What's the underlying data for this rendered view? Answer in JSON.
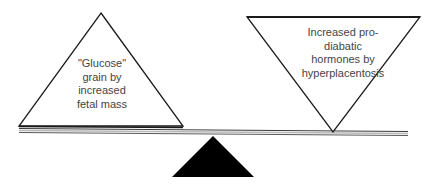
{
  "diagram": {
    "type": "balance-scale",
    "left_weight": {
      "shape": "triangle-up",
      "label": "\"Glucose\"\ngrain by\nincreased\nfetal mass"
    },
    "right_weight": {
      "shape": "triangle-down",
      "label": "Increased pro-\ndiabatic\nhormones by\nhyperplacentosis"
    },
    "beam": {
      "shape": "double-line"
    },
    "fulcrum": {
      "shape": "filled-triangle"
    },
    "colors": {
      "stroke": "#1a1a1a",
      "beam": "#8a8a8a",
      "fulcrum": "#000000",
      "text": "#444444",
      "background": "#ffffff"
    }
  }
}
